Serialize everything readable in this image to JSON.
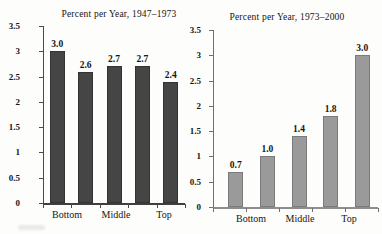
{
  "figure": {
    "background": "#fdfdfb",
    "text_color": "#151515"
  },
  "chart_data": [
    {
      "type": "bar",
      "title": "Percent per Year, 1947–1973",
      "values": [
        3.0,
        2.6,
        2.7,
        2.7,
        2.4
      ],
      "bar_labels": [
        "3.0",
        "2.6",
        "2.7",
        "2.7",
        "2.4"
      ],
      "x_tick_labels": [
        "Bottom",
        "Middle",
        "Top"
      ],
      "ylim": [
        0,
        3.5
      ],
      "y_ticks": [
        0,
        0.5,
        1,
        1.5,
        2,
        2.5,
        3,
        3.5
      ],
      "y_tick_labels": [
        "0",
        "0.5",
        "1",
        "1.5",
        "2",
        "2.5",
        "3",
        "3.5"
      ],
      "bar_color": "#454545",
      "bar_border": "#333333",
      "axis_color": "#4a4a4a",
      "baseline_color": "#3f3f3f",
      "grid": false,
      "legend": "none"
    },
    {
      "type": "bar",
      "title": "Percent per Year, 1973–2000",
      "values": [
        0.7,
        1.0,
        1.4,
        1.8,
        3.0
      ],
      "bar_labels": [
        "0.7",
        "1.0",
        "1.4",
        "1.8",
        "3.0"
      ],
      "x_tick_labels": [
        "Bottom",
        "Middle",
        "Top"
      ],
      "ylim": [
        0,
        3.5
      ],
      "y_ticks": [
        0,
        0.5,
        1,
        1.5,
        2,
        2.5,
        3,
        3.5
      ],
      "y_tick_labels": [
        "0",
        "0.5",
        "1",
        "1.5",
        "2",
        "2.5",
        "3",
        "3.5"
      ],
      "bar_color": "#9a9a9a",
      "bar_border": "#7a7a7a",
      "axis_color": "#6f6f6f",
      "baseline_color": "#8d8d8d",
      "grid": false,
      "legend": "none"
    }
  ]
}
